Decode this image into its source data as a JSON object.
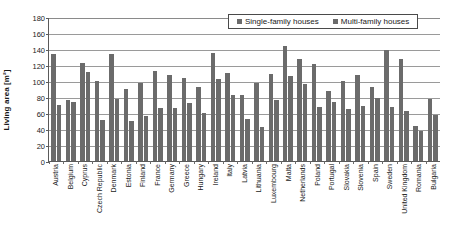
{
  "chart_data": {
    "type": "bar",
    "title": "",
    "xlabel": "",
    "ylabel": "Living area [m²]",
    "ylim": [
      0,
      180
    ],
    "yticks": [
      0,
      20,
      40,
      60,
      80,
      100,
      120,
      140,
      160,
      180
    ],
    "grid": true,
    "legend_position": "top-right",
    "categories": [
      "Austria",
      "Belgium",
      "Cyprus",
      "Czech Republic",
      "Denmark",
      "Estonia",
      "Finland",
      "France",
      "Germany",
      "Greece",
      "Hungary",
      "Ireland",
      "Italy",
      "Latvia",
      "Lithuania",
      "Luxembourg",
      "Malta",
      "Netherlands",
      "Poland",
      "Portugal",
      "Slovakia",
      "Slovenia",
      "Spain",
      "Sweden",
      "United Kingdom",
      "Romania",
      "Bulgaria"
    ],
    "series": [
      {
        "name": "Single-family houses",
        "color": "#6b6b6b",
        "values": [
          134,
          76,
          122,
          100,
          134,
          90,
          97,
          112,
          107,
          104,
          93,
          135,
          110,
          82,
          97,
          109,
          144,
          127,
          121,
          88,
          100,
          107,
          92,
          139,
          127,
          44,
          77
        ]
      },
      {
        "name": "Multi-family houses",
        "color": "#6b6b6b",
        "values": [
          70,
          74,
          111,
          51,
          78,
          50,
          56,
          66,
          66,
          73,
          60,
          102,
          83,
          53,
          42,
          76,
          106,
          96,
          68,
          74,
          65,
          69,
          79,
          68,
          62,
          37,
          58
        ]
      }
    ]
  },
  "legend": {
    "items": [
      {
        "label": "Single-family houses"
      },
      {
        "label": "Multi-family houses"
      }
    ]
  }
}
